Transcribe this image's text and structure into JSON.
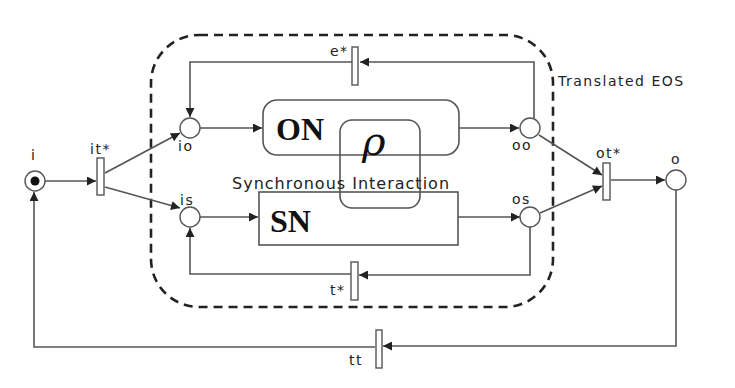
{
  "diagram": {
    "type": "petri-net",
    "region_label": "Translated EOS",
    "interaction_label": "Synchronous Interaction",
    "rho_symbol": "ρ",
    "nets": {
      "on": "ON",
      "sn": "SN"
    },
    "places": {
      "i": "i",
      "io": "io",
      "is": "is",
      "oo": "oo",
      "os": "os",
      "o": "o"
    },
    "transitions": {
      "it": "it*",
      "ot": "ot*",
      "e": "e*",
      "t": "t*",
      "tt": "tt"
    },
    "initial_marking": "i",
    "colors": {
      "stroke": "#555555",
      "text": "#222222",
      "background": "#ffffff"
    }
  }
}
